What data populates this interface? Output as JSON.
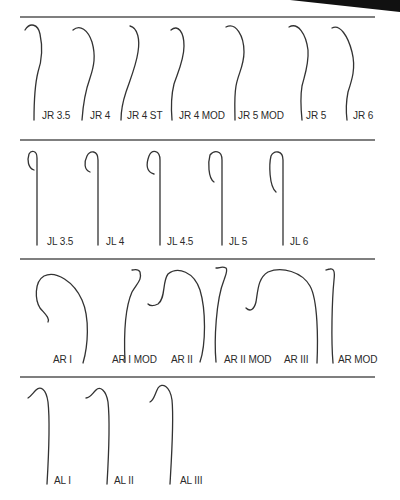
{
  "figure": {
    "rows": [
      {
        "group": "Judkins Right",
        "items": [
          {
            "label": "JR 3.5",
            "x": 35,
            "labelX": 42
          },
          {
            "label": "JR 4",
            "x": 82,
            "labelX": 90
          },
          {
            "label": "JR 4 ST",
            "x": 137,
            "labelX": 127
          },
          {
            "label": "JR 4 MOD",
            "x": 178,
            "labelX": 179
          },
          {
            "label": "JR 5 MOD",
            "x": 235,
            "labelX": 238
          },
          {
            "label": "JR 5",
            "x": 296,
            "labelX": 306
          },
          {
            "label": "JR 6",
            "x": 340,
            "labelX": 353
          }
        ]
      },
      {
        "group": "Judkins Left",
        "items": [
          {
            "label": "JL 3.5",
            "labelX": 47
          },
          {
            "label": "JL 4",
            "labelX": 106
          },
          {
            "label": "JL 4.5",
            "labelX": 167
          },
          {
            "label": "JL 5",
            "labelX": 229
          },
          {
            "label": "JL 6",
            "labelX": 290
          }
        ]
      },
      {
        "group": "Amplatz Right",
        "items": [
          {
            "label": "AR I",
            "labelX": 53
          },
          {
            "label": "AR I MOD",
            "labelX": 112
          },
          {
            "label": "AR II",
            "labelX": 171
          },
          {
            "label": "AR II MOD",
            "labelX": 224
          },
          {
            "label": "AR III",
            "labelX": 284
          },
          {
            "label": "AR MOD",
            "labelX": 338
          }
        ]
      },
      {
        "group": "Amplatz Left",
        "items": [
          {
            "label": "AL I",
            "labelX": 54
          },
          {
            "label": "AL II",
            "labelX": 114
          },
          {
            "label": "AL III",
            "labelX": 180
          }
        ]
      }
    ],
    "colors": {
      "line": "#333333",
      "divider": "#555555",
      "text": "#2a2a2a"
    }
  }
}
